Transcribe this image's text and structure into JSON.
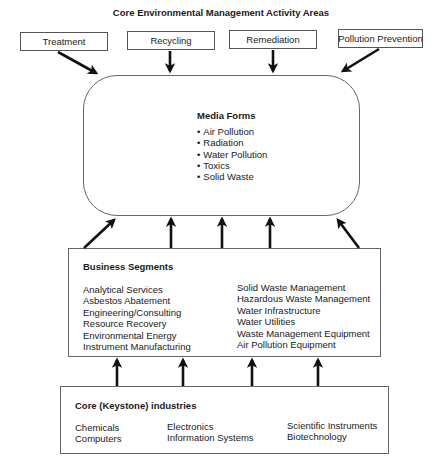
{
  "title": "Core Environmental Management Activity Areas",
  "activity_areas": [
    {
      "label": "Treatment"
    },
    {
      "label": "Recycling"
    },
    {
      "label": "Remediation"
    },
    {
      "label": "Pollution Prevention"
    }
  ],
  "media_forms": {
    "title": "Media Forms",
    "items": [
      "Air Pollution",
      "Radiation",
      "Water Pollution",
      "Toxics",
      "Solid Waste"
    ]
  },
  "business_segments": {
    "title": "Business Segments",
    "left_column": [
      "Analytical Services",
      "Asbestos Abatement",
      "Engineering/Consulting",
      "Resource Recovery",
      "Environmental Energy",
      "Instrument Manufacturing"
    ],
    "right_column": [
      "Solid Waste Management",
      "Hazardous Waste Management",
      "Water Infrastructure",
      "Water Utilities",
      "Waste Management Equipment",
      "Air Pollution Equipment"
    ]
  },
  "core_industries": {
    "title": "Core (Keystone) industries",
    "columns": [
      [
        "Chemicals",
        "Computers"
      ],
      [
        "Electronics",
        "Information Systems"
      ],
      [
        "Scientific Instruments",
        "Biotechnology"
      ]
    ]
  }
}
